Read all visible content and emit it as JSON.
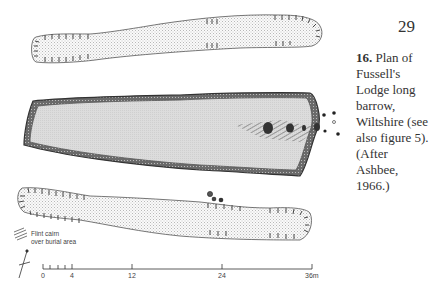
{
  "page": {
    "number": "29"
  },
  "caption": {
    "figure_number": "16.",
    "text": "Plan of Fussell's Lodge long barrow, Wiltshire (see also figure 5). (After Ashbee, 1966.)"
  },
  "legend": {
    "line1": "Flint cairn",
    "line2": "over burial area"
  },
  "scale": {
    "ticks": [
      "0",
      "4",
      "12",
      "24",
      "36m"
    ]
  },
  "colors": {
    "stipple": "#cfcfcf",
    "fill_grey": "#d8d8d8",
    "outline": "#444444",
    "ditch": "#5a5a5a"
  }
}
